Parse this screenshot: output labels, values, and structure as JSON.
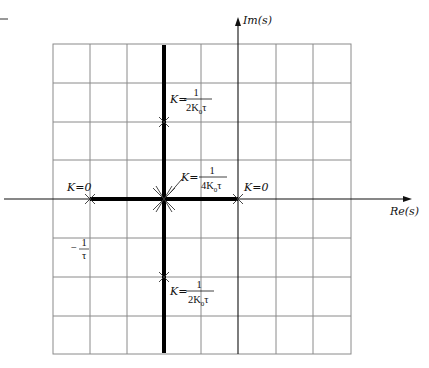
{
  "diagram": {
    "axes": {
      "real_label": "Re(s)",
      "imag_label": "Im(s)"
    },
    "labels": {
      "k_zero_left": "K=0",
      "k_zero_right": "K=0",
      "k_top_prefix": "K=",
      "k_top_num": "1",
      "k_top_den": "2K",
      "k_top_den_sub": "0",
      "k_top_den_suffix": "τ",
      "k_mid_prefix": "K=",
      "k_mid_num": "1",
      "k_mid_den": "4K",
      "k_mid_den_sub": "0",
      "k_mid_den_suffix": "τ",
      "k_bot_prefix": "K=",
      "k_bot_num": "1",
      "k_bot_den": "2K",
      "k_bot_den_sub": "0",
      "k_bot_den_suffix": "τ",
      "neg_inv_tau_sign": "−",
      "neg_inv_tau_num": "1",
      "neg_inv_tau_den": "τ"
    },
    "poles": [
      {
        "name": "open-loop-pole-left",
        "x": 90,
        "y": 199
      },
      {
        "name": "open-loop-pole-origin",
        "x": 238,
        "y": 199
      },
      {
        "name": "breakaway-point",
        "x": 164,
        "y": 199
      },
      {
        "name": "locus-point-upper",
        "x": 164,
        "y": 122
      },
      {
        "name": "locus-point-lower",
        "x": 164,
        "y": 277
      }
    ],
    "grid": {
      "columns_x": [
        53,
        90,
        127,
        164,
        201,
        238,
        276,
        313,
        351
      ],
      "rows_y": [
        44,
        83,
        122,
        160,
        199,
        238,
        277,
        316,
        354
      ]
    },
    "colors": {
      "grid": "#8a8a8a",
      "locus": "#000000",
      "background": "#ffffff"
    }
  }
}
